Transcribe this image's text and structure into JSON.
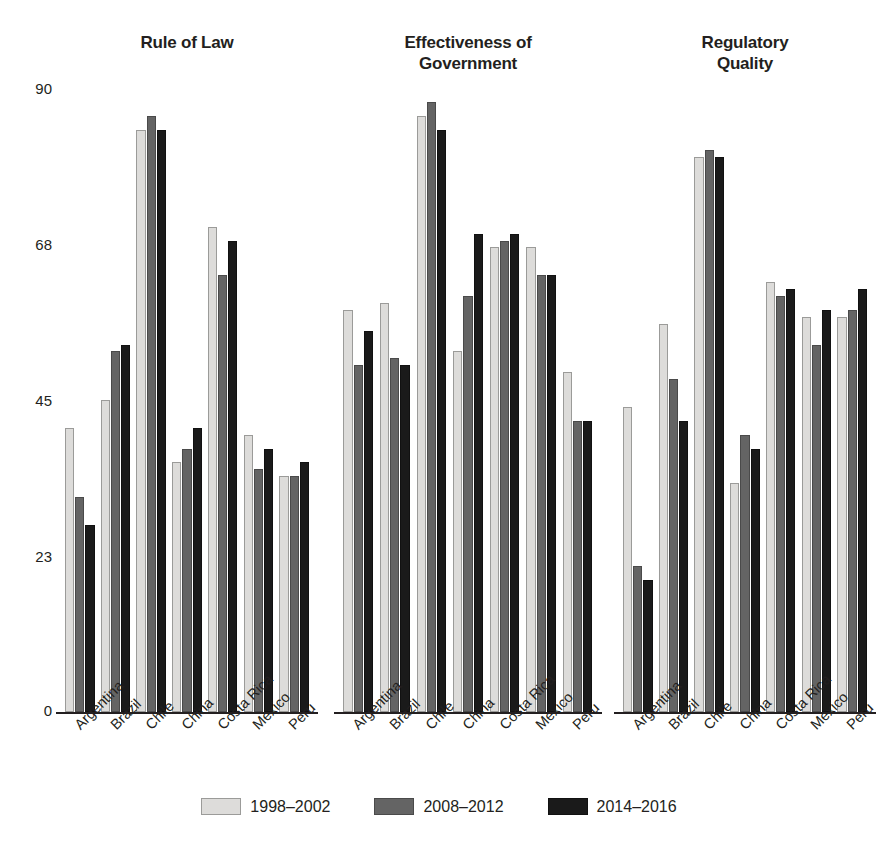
{
  "chart_data": {
    "type": "bar",
    "title": "",
    "xlabel": "",
    "ylabel": "",
    "ylim": [
      0,
      90
    ],
    "grid": false,
    "legend_position": "bottom",
    "yticks": [
      90,
      68,
      45,
      23,
      0
    ],
    "categories": [
      "Argentina",
      "Brazil",
      "Chile",
      "China",
      "Costa Rica",
      "Mexico",
      "Peru"
    ],
    "legend": [
      "1998–2002",
      "2008–2012",
      "2014–2016"
    ],
    "panels": [
      {
        "title": "Rule of Law",
        "series": [
          {
            "name": "1998–2002",
            "values": [
              41,
              45,
              84,
              36,
              70,
              40,
              34
            ]
          },
          {
            "name": "2008–2012",
            "values": [
              31,
              52,
              86,
              38,
              63,
              35,
              34
            ]
          },
          {
            "name": "2014–2016",
            "values": [
              27,
              53,
              84,
              41,
              68,
              38,
              36
            ]
          }
        ]
      },
      {
        "title": "Effectiveness of Government",
        "title_lines": [
          "Effectiveness of",
          "Government"
        ],
        "series": [
          {
            "name": "1998–2002",
            "values": [
              58,
              59,
              86,
              52,
              67,
              67,
              49
            ]
          },
          {
            "name": "2008–2012",
            "values": [
              50,
              51,
              88,
              60,
              68,
              63,
              42
            ]
          },
          {
            "name": "2014–2016",
            "values": [
              55,
              50,
              84,
              69,
              69,
              63,
              42
            ]
          }
        ]
      },
      {
        "title": "Regulatory Quality",
        "title_lines": [
          "Regulatory",
          "Quality"
        ],
        "series": [
          {
            "name": "1998–2002",
            "values": [
              44,
              56,
              80,
              33,
              62,
              57,
              57
            ]
          },
          {
            "name": "2008–2012",
            "values": [
              21,
              48,
              81,
              40,
              60,
              53,
              58
            ]
          },
          {
            "name": "2014–2016",
            "values": [
              19,
              42,
              80,
              38,
              61,
              58,
              61
            ]
          }
        ]
      }
    ],
    "colors": {
      "series_1998_2002": "#dddcda",
      "series_2008_2012": "#646464",
      "series_2014_2016": "#1a1a1a",
      "axis": "#231f20",
      "background": "#ffffff"
    }
  }
}
